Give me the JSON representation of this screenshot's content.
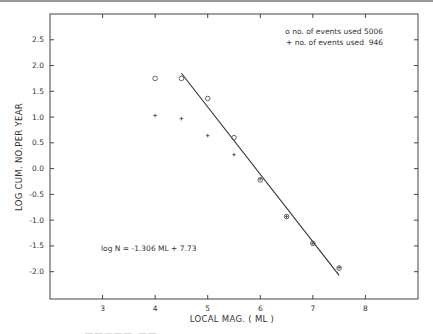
{
  "chart_data": {
    "type": "scatter",
    "title": "",
    "xlabel": "LOCAL MAG. ( ML )",
    "ylabel": "LOG CUM. NO.PER YEAR",
    "xlim": [
      2,
      9
    ],
    "ylim": [
      -2.53,
      3.0
    ],
    "x_ticks": [
      3,
      4,
      5,
      6,
      7,
      8
    ],
    "x_tick_labels": [
      "3",
      "4",
      "5",
      "6",
      "7",
      "8"
    ],
    "y_ticks": [
      2.5,
      2.0,
      1.5,
      1.0,
      0.5,
      0.0,
      -0.5,
      -1.0,
      -1.5,
      -2.0
    ],
    "y_tick_labels": [
      "2.5",
      "2.0",
      "1.5",
      "1.0",
      "0.5",
      "0.0",
      "-0.5",
      "-1.0",
      "-1.5",
      "-2.0"
    ],
    "grid": false,
    "legend_position": "upper right",
    "series": [
      {
        "name": "o no. of events used 5006",
        "marker": "circle",
        "x": [
          4.0,
          4.5,
          5.0,
          5.5,
          6.0,
          6.5,
          7.0,
          7.5
        ],
        "y": [
          1.75,
          1.75,
          1.36,
          0.6,
          -0.22,
          -0.93,
          -1.45,
          -1.93
        ]
      },
      {
        "name": "+ no. of events used  946",
        "marker": "plus",
        "x": [
          4.0,
          4.5,
          5.0,
          5.5,
          6.0,
          6.5,
          7.0,
          7.5
        ],
        "y": [
          1.03,
          0.97,
          0.64,
          0.27,
          -0.2,
          -0.93,
          -1.45,
          -1.92
        ]
      },
      {
        "name": "fit line",
        "type": "line",
        "x": [
          4.5,
          7.5
        ],
        "y": [
          1.85,
          -2.07
        ]
      }
    ],
    "annotations": [
      "log N = -1.306 ML + 7.73"
    ]
  },
  "legend": {
    "line1": "o no. of events used 5006",
    "line2": "+ no. of events used  946"
  },
  "annotation": "log N = -1.306 ML + 7.73",
  "axes": {
    "xlabel": "LOCAL MAG. ( ML )",
    "ylabel": "LOG CUM. NO.PER YEAR"
  },
  "colors": {
    "ink": "#333333",
    "frame": "#444444"
  }
}
